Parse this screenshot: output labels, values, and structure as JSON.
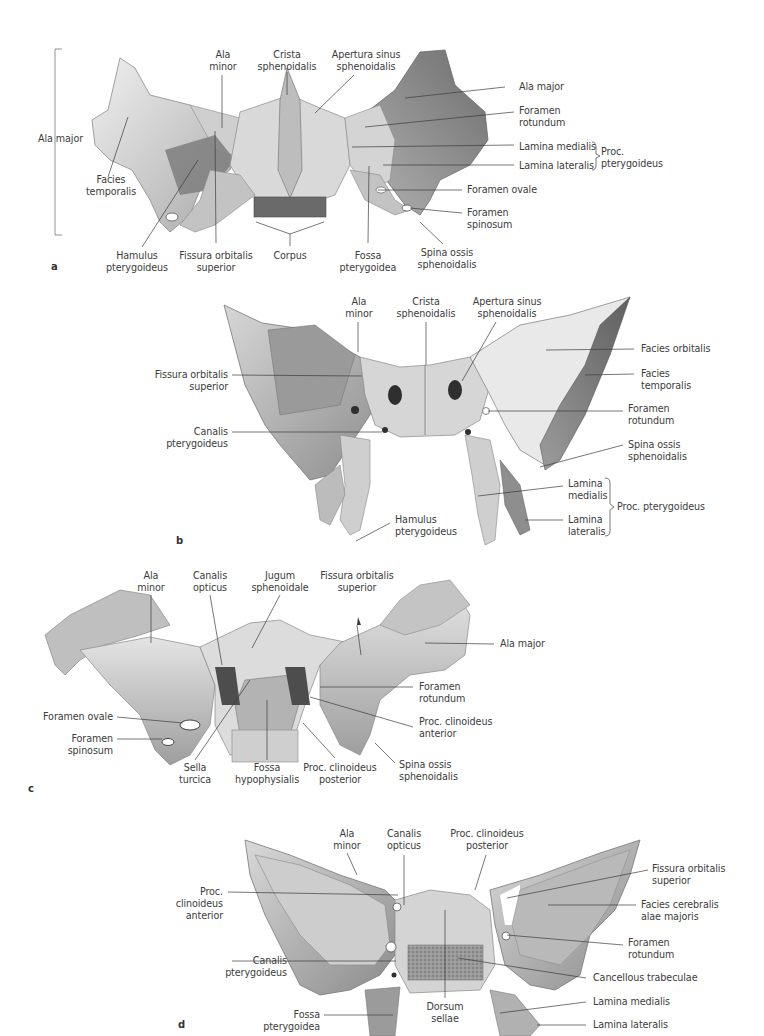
{
  "figure": {
    "panels": [
      {
        "id": "a",
        "letter": "a",
        "labels": {
          "ala_major_left": "Ala major",
          "ala_minor": "Ala\nminor",
          "crista_sphenoidalis": "Crista\nsphenoidalis",
          "apertura_sinus": "Apertura sinus\nsphenoidalis",
          "ala_major_right": "Ala major",
          "foramen_rotundum": "Foramen\nrotundum",
          "lamina_medialis": "Lamina medialis",
          "lamina_lateralis": "Lamina lateralis",
          "proc_pterygoideus": "Proc.\npterygoideus",
          "foramen_ovale": "Foramen ovale",
          "foramen_spinosum": "Foramen\nspinosum",
          "facies_temporalis": "Facies\ntemporalis",
          "hamulus_pterygoideus": "Hamulus\npterygoideus",
          "fissura_orbitalis_superior": "Fissura orbitalis\nsuperior",
          "corpus": "Corpus",
          "fossa_pterygoidea": "Fossa\npterygoidea",
          "spina_ossis": "Spina ossis\nsphenoidalis"
        }
      },
      {
        "id": "b",
        "letter": "b",
        "labels": {
          "ala_minor": "Ala\nminor",
          "crista_sphenoidalis": "Crista\nsphenoidalis",
          "apertura_sinus": "Apertura sinus\nsphenoidalis",
          "fissura_orbitalis_superior": "Fissura orbitalis\nsuperior",
          "canalis_pterygoideus": "Canalis\npterygoideus",
          "facies_orbitalis": "Facies orbitalis",
          "facies_temporalis": "Facies\ntemporalis",
          "foramen_rotundum": "Foramen\nrotundum",
          "spina_ossis": "Spina ossis\nsphenoidalis",
          "lamina_medialis": "Lamina\nmedialis",
          "lamina_lateralis": "Lamina\nlateralis",
          "proc_pterygoideus": "Proc. pterygoideus",
          "hamulus_pterygoideus": "Hamulus\npterygoideus"
        }
      },
      {
        "id": "c",
        "letter": "c",
        "labels": {
          "ala_minor": "Ala\nminor",
          "canalis_opticus": "Canalis\nopticus",
          "jugum_sphenoidale": "Jugum\nsphenoidale",
          "fissura_orbitalis_superior": "Fissura orbitalis\nsuperior",
          "ala_major": "Ala major",
          "foramen_rotundum": "Foramen\nrotundum",
          "proc_clinoideus_anterior": "Proc. clinoideus\nanterior",
          "foramen_ovale": "Foramen ovale",
          "foramen_spinosum": "Foramen\nspinosum",
          "sella_turcica": "Sella\nturcica",
          "fossa_hypophysialis": "Fossa\nhypophysialis",
          "proc_clinoideus_posterior": "Proc. clinoideus\nposterior",
          "spina_ossis": "Spina ossis\nsphenoidalis"
        }
      },
      {
        "id": "d",
        "letter": "d",
        "labels": {
          "ala_minor": "Ala\nminor",
          "canalis_opticus": "Canalis\nopticus",
          "proc_clinoideus_posterior": "Proc. clinoideus\nposterior",
          "proc_clinoideus_anterior": "Proc.\nclinoideus\nanterior",
          "fissura_orbitalis_superior": "Fissura orbitalis\nsuperior",
          "facies_cerebralis": "Facies cerebralis\nalae majoris",
          "foramen_rotundum": "Foramen\nrotundum",
          "canalis_pterygoideus": "Canalis\npterygoideus",
          "cancellous_trabeculae": "Cancellous trabeculae",
          "lamina_medialis": "Lamina medialis",
          "lamina_lateralis": "Lamina lateralis",
          "fossa_pterygoidea": "Fossa\npterygoidea",
          "dorsum_sellae": "Dorsum\nsellae"
        }
      }
    ],
    "colors": {
      "bone_light": "#e6e6e6",
      "bone_mid": "#bdbdbd",
      "bone_dark": "#7a7a7a",
      "bone_shadow": "#4a4a4a",
      "leader_line": "#3c3c3c",
      "text": "#3c3c3c"
    }
  }
}
